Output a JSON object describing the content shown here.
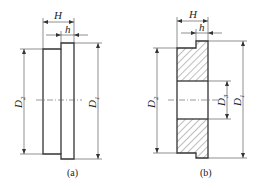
{
  "figures": [
    {
      "id": "a",
      "caption": "(a)",
      "labels": {
        "H": "H",
        "h": "h",
        "D1": "D",
        "D1_sub": "1",
        "D2": "D",
        "D2_sub": "2"
      }
    },
    {
      "id": "b",
      "caption": "(b)",
      "labels": {
        "H": "H",
        "h": "h",
        "D1": "D",
        "D1_sub": "1",
        "D2": "D",
        "D2_sub": "2",
        "D3": "D",
        "D3_sub": "3"
      }
    }
  ],
  "colors": {
    "line": "#333333",
    "background": "#ffffff"
  }
}
